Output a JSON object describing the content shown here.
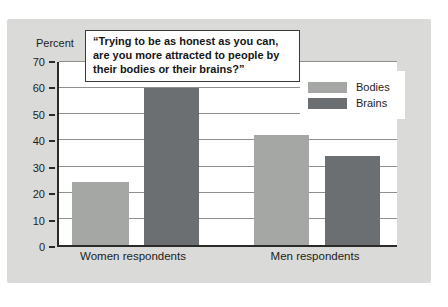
{
  "chart_data": {
    "type": "bar",
    "title": "“Trying to be as honest as you can, are you more attracted to people by their bodies or their brains?”",
    "ylabel": "Percent",
    "xlabel": "",
    "categories": [
      "Women respondents",
      "Men respondents"
    ],
    "series": [
      {
        "name": "Bodies",
        "color": "#a4a7a3",
        "values": [
          24,
          42
        ]
      },
      {
        "name": "Brains",
        "color": "#6b6f71",
        "values": [
          60,
          34
        ]
      }
    ],
    "ylim": [
      0,
      70
    ],
    "yticks": [
      0,
      10,
      20,
      30,
      40,
      50,
      60,
      70
    ],
    "grid": true,
    "legend_position": "top-right",
    "colors": {
      "panel_bg": "#dadad8",
      "plot_bg": "#ffffff",
      "gridline": "#8f8f8f",
      "axis": "#2a2a28",
      "text": "#1d1d1b"
    }
  }
}
